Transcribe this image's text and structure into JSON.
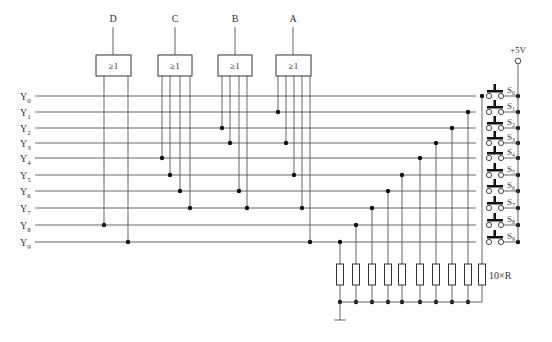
{
  "diagram": {
    "title": "",
    "type": "circuit-schematic",
    "gates": [
      {
        "output": "D",
        "symbol": "≥1",
        "inputs": [
          "Y8",
          "Y9"
        ]
      },
      {
        "output": "C",
        "symbol": "≥1",
        "inputs": [
          "Y4",
          "Y5",
          "Y6",
          "Y7"
        ]
      },
      {
        "output": "B",
        "symbol": "≥1",
        "inputs": [
          "Y2",
          "Y3",
          "Y6",
          "Y7"
        ]
      },
      {
        "output": "A",
        "symbol": "≥1",
        "inputs": [
          "Y1",
          "Y3",
          "Y5",
          "Y7",
          "Y9"
        ]
      }
    ],
    "input_lines": [
      "Y0",
      "Y1",
      "Y2",
      "Y3",
      "Y4",
      "Y5",
      "Y6",
      "Y7",
      "Y8",
      "Y9"
    ],
    "switches": [
      "S0",
      "S1",
      "S2",
      "S3",
      "S4",
      "S5",
      "S6",
      "S7",
      "S8",
      "S9"
    ],
    "supply_label": "+5V",
    "resistor_label": "10×R",
    "colors": {
      "line": "#555555",
      "text": "#333333",
      "background": "#ffffff"
    }
  }
}
